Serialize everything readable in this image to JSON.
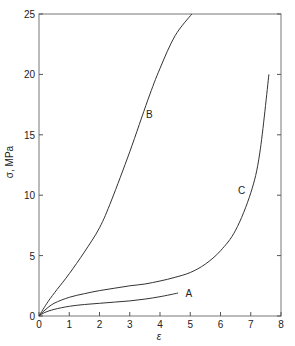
{
  "chart_data": {
    "type": "line",
    "title": "",
    "xlabel": "ε",
    "ylabel": "σ, MPa",
    "xlim": [
      0,
      8
    ],
    "ylim": [
      0,
      25
    ],
    "xticks": [
      0,
      1,
      2,
      3,
      4,
      5,
      6,
      7,
      8
    ],
    "yticks": [
      0,
      5,
      10,
      15,
      20,
      25
    ],
    "grid": false,
    "legend": "none; curves labeled inline",
    "series": [
      {
        "name": "A",
        "label_pos": [
          4.95,
          1.9
        ],
        "points": [
          [
            0,
            0
          ],
          [
            0.2,
            0.3
          ],
          [
            0.5,
            0.55
          ],
          [
            1,
            0.8
          ],
          [
            1.5,
            0.95
          ],
          [
            2,
            1.05
          ],
          [
            2.5,
            1.15
          ],
          [
            3,
            1.25
          ],
          [
            3.5,
            1.4
          ],
          [
            4,
            1.6
          ],
          [
            4.6,
            1.9
          ]
        ]
      },
      {
        "name": "B",
        "label_pos": [
          3.65,
          16.7
        ],
        "points": [
          [
            0,
            0
          ],
          [
            0.3,
            1.2
          ],
          [
            0.6,
            2.2
          ],
          [
            1,
            3.5
          ],
          [
            1.5,
            5.3
          ],
          [
            2,
            7.3
          ],
          [
            2.4,
            9.6
          ],
          [
            3,
            13.6
          ],
          [
            3.6,
            17.9
          ],
          [
            4,
            20.5
          ],
          [
            4.5,
            23.2
          ],
          [
            5.05,
            25
          ]
        ]
      },
      {
        "name": "C",
        "label_pos": [
          6.7,
          10.4
        ],
        "points": [
          [
            0,
            0
          ],
          [
            0.2,
            0.5
          ],
          [
            0.5,
            1.05
          ],
          [
            1,
            1.55
          ],
          [
            1.5,
            1.85
          ],
          [
            2,
            2.1
          ],
          [
            2.5,
            2.3
          ],
          [
            3,
            2.5
          ],
          [
            3.5,
            2.65
          ],
          [
            4,
            2.9
          ],
          [
            4.5,
            3.2
          ],
          [
            5,
            3.6
          ],
          [
            5.5,
            4.3
          ],
          [
            6,
            5.4
          ],
          [
            6.5,
            7.1
          ],
          [
            7,
            10.2
          ],
          [
            7.3,
            13.5
          ],
          [
            7.6,
            20
          ]
        ]
      }
    ]
  }
}
